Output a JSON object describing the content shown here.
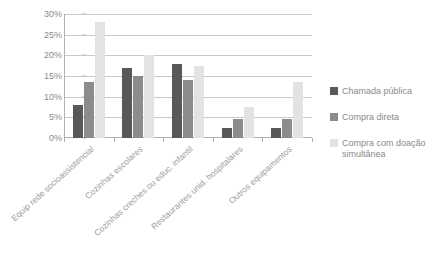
{
  "chart_data": {
    "type": "bar",
    "title": "",
    "subtitle": "",
    "xlabel": "",
    "ylabel": "",
    "ylim": [
      0,
      30
    ],
    "y_tick_labels": [
      "0%",
      "5%",
      "10%",
      "15%",
      "20%",
      "25%",
      "30%"
    ],
    "y_tick_values": [
      0,
      5,
      10,
      15,
      20,
      25,
      30
    ],
    "grid": true,
    "legend_position": "right",
    "categories": [
      "Equip rede socioassistencial",
      "Cozinhas escolares",
      "Cozinhas creches ou educ. infantil",
      "Restaurantes unid. hospitalares",
      "Outros equipamentos"
    ],
    "series": [
      {
        "name": "Chamada pública",
        "color": "#595959",
        "values": [
          8,
          17,
          18,
          2.5,
          2.5
        ]
      },
      {
        "name": "Compra direta",
        "color": "#8c8c8c",
        "values": [
          13.5,
          15,
          14,
          4.5,
          4.5
        ]
      },
      {
        "name": "Compra com doação simultânea",
        "color": "#e3e3e3",
        "values": [
          28,
          20,
          17.5,
          7.5,
          13.5
        ]
      }
    ]
  },
  "legend": {
    "items": [
      {
        "label": "Chamada pública",
        "color": "#595959"
      },
      {
        "label": "Compra direta",
        "color": "#8c8c8c"
      },
      {
        "label": "Compra com doação simultânea",
        "color": "#e3e3e3"
      }
    ]
  },
  "colors": {
    "axis": "#b0b0b0",
    "grid": "#c9c9c9",
    "text": "#8a8a8a",
    "background": "#ffffff"
  }
}
